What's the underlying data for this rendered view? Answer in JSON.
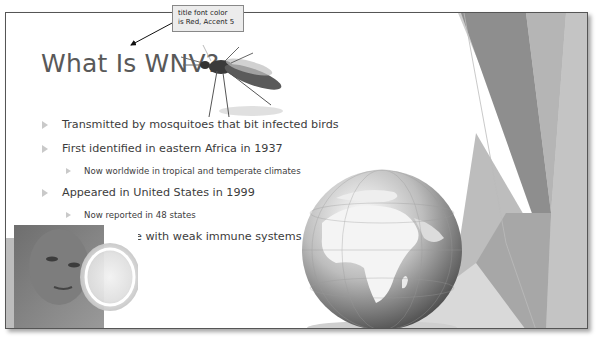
{
  "slide": {
    "title": "What Is WNV?",
    "title_color": "#595959",
    "bullets": [
      {
        "level": 1,
        "text": "Transmitted by mosquitoes that bit infected birds"
      },
      {
        "level": 1,
        "text": "First identified in eastern Africa in 1937"
      },
      {
        "level": 2,
        "text": "Now worldwide in tropical and temperate climates"
      },
      {
        "level": 1,
        "text": "Appeared in United States in 1999"
      },
      {
        "level": 2,
        "text": "Now reported in 48 states"
      },
      {
        "level": 1,
        "text": "At risk: People with weak immune systems"
      }
    ],
    "images": {
      "mosquito": "mosquito-image",
      "globe": "globe-image",
      "photo": "person-with-petri-dish-image"
    },
    "theme_colors": {
      "background": "#ffffff",
      "shape_dark": "#8c8c8c",
      "shape_mid": "#a9a9a9",
      "shape_light": "#d4d4d4",
      "bullet_arrow": "#c9c9c9"
    }
  },
  "callout": {
    "line1": "title font color",
    "line2": "is Red, Accent 5"
  }
}
